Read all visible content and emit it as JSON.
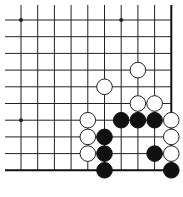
{
  "board": {
    "grid": {
      "x0": 21,
      "y0": 20,
      "spacing": 16.7,
      "cols": 10,
      "rows": 10,
      "right_edge_col": 9,
      "bottom_edge_row": 9,
      "line_color": "#222222",
      "edge_color": "#111111"
    },
    "star_points": [
      [
        0,
        0
      ],
      [
        6,
        0
      ],
      [
        0,
        6
      ]
    ],
    "stones": {
      "white": [
        [
          7,
          3
        ],
        [
          5,
          4
        ],
        [
          7,
          5
        ],
        [
          8,
          5
        ],
        [
          4,
          6
        ],
        [
          9,
          6
        ],
        [
          4,
          7
        ],
        [
          9,
          7
        ],
        [
          4,
          8
        ],
        [
          9,
          8
        ]
      ],
      "black": [
        [
          6,
          6
        ],
        [
          7,
          6
        ],
        [
          8,
          6
        ],
        [
          5,
          7
        ],
        [
          5,
          8
        ],
        [
          8,
          8
        ],
        [
          5,
          9
        ],
        [
          9,
          9
        ]
      ]
    },
    "colors": {
      "black_stone": "#111111",
      "white_stone": "#ffffff",
      "stone_outline": "#222222"
    }
  }
}
